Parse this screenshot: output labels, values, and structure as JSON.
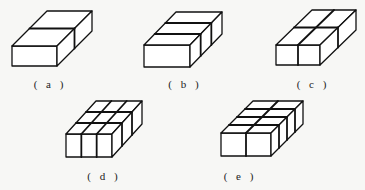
{
  "figures": [
    {
      "id": "a",
      "label": "( a )",
      "front": {
        "x": 12,
        "y": 46,
        "w": 45,
        "h": 20
      },
      "depth": {
        "dx": 35,
        "dy": -35
      },
      "cols": 1,
      "rows": 2,
      "label_pos": {
        "x": 50,
        "y": 78
      }
    },
    {
      "id": "b",
      "label": "( b )",
      "front": {
        "x": 144,
        "y": 45,
        "w": 46,
        "h": 22
      },
      "depth": {
        "dx": 32,
        "dy": -33
      },
      "cols": 1,
      "rows": 3,
      "label_pos": {
        "x": 185,
        "y": 78
      }
    },
    {
      "id": "c",
      "label": "( c )",
      "front": {
        "x": 276,
        "y": 45,
        "w": 44,
        "h": 20
      },
      "depth": {
        "dx": 36,
        "dy": -35
      },
      "cols": 2,
      "rows": 2,
      "label_pos": {
        "x": 313,
        "y": 78
      }
    },
    {
      "id": "d",
      "label": "( d )",
      "front": {
        "x": 66,
        "y": 134,
        "w": 46,
        "h": 23
      },
      "depth": {
        "dx": 30,
        "dy": -33
      },
      "cols": 3,
      "rows": 3,
      "label_pos": {
        "x": 104,
        "y": 170
      }
    },
    {
      "id": "e",
      "label": "( e )",
      "front": {
        "x": 221,
        "y": 133,
        "w": 50,
        "h": 23
      },
      "depth": {
        "dx": 32,
        "dy": -32
      },
      "cols": 2,
      "rows": 4,
      "label_pos": {
        "x": 240,
        "y": 170
      }
    }
  ],
  "style": {
    "stroke": "#111111",
    "stroke_width": 1.3,
    "divider_width": 1.8
  }
}
